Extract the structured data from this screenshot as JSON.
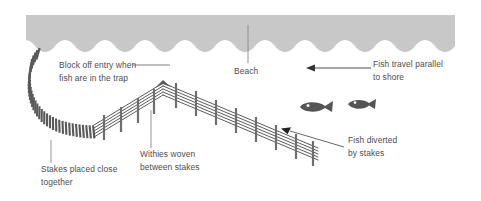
{
  "diagram": {
    "colors": {
      "beach_fill": "#c8c8c8",
      "stake_dark": "#555555",
      "stake_mid": "#6e6e6e",
      "withy_line": "#3d3d3d",
      "fish_fill": "#555555",
      "text": "#4c4c4c",
      "leader_line": "#8a8a8a",
      "arrow": "#444444",
      "background": "#ffffff"
    },
    "beach": {
      "label": "Beach",
      "region_name": "beach-band"
    },
    "annotations": [
      {
        "id": "block-off-entry",
        "line1": "Block off entry when",
        "line2": "fish are in the trap",
        "leader": "horizontal-right"
      },
      {
        "id": "beach",
        "line1": "Beach",
        "line2": "",
        "leader": "vertical-up"
      },
      {
        "id": "fish-travel-parallel",
        "line1": "Fish travel parallel",
        "line2": "to shore",
        "leader": "arrow-left"
      },
      {
        "id": "fish-diverted-by-stakes",
        "line1": "Fish diverted",
        "line2": "by stakes",
        "leader": "arrow-diagonal-upleft"
      },
      {
        "id": "stakes-placed-close",
        "line1": "Stakes placed close",
        "line2": "together",
        "leader": "vertical-up"
      },
      {
        "id": "withies-woven",
        "line1": "Withies woven",
        "line2": "between stakes",
        "leader": "vertical-up"
      }
    ],
    "fish": [
      {
        "id": "fish-1",
        "direction": "left"
      },
      {
        "id": "fish-2",
        "direction": "left"
      }
    ],
    "structure": {
      "dense_stake_arc_name": "dense-stake-arc",
      "withy_fence_name": "withy-fence",
      "apex_name": "fence-apex"
    }
  }
}
